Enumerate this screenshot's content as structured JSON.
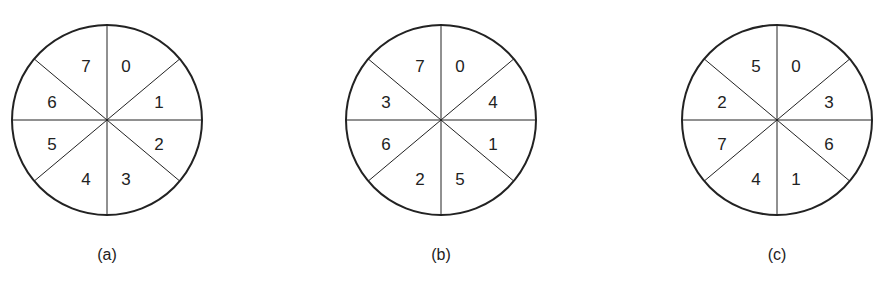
{
  "figure": {
    "disks": [
      {
        "caption": "(a)",
        "sectors": [
          "0",
          "1",
          "2",
          "3",
          "4",
          "5",
          "6",
          "7"
        ]
      },
      {
        "caption": "(b)",
        "sectors": [
          "0",
          "4",
          "1",
          "5",
          "2",
          "6",
          "3",
          "7"
        ]
      },
      {
        "caption": "(c)",
        "sectors": [
          "0",
          "3",
          "6",
          "1",
          "4",
          "7",
          "2",
          "5"
        ]
      }
    ]
  },
  "style": {
    "stroke": "#222222",
    "background": "#ffffff"
  }
}
